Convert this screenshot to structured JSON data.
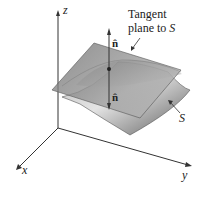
{
  "diagram": {
    "axes": {
      "z_label": "z",
      "x_label": "x",
      "y_label": "y"
    },
    "labels": {
      "tangent_line1": "Tangent",
      "tangent_line2_prefix": "plane to ",
      "tangent_line2_S": "S",
      "surface": "S",
      "normal_up": "n̂",
      "normal_down": "n̂"
    },
    "colors": {
      "axis": "#333333",
      "plane": "#8a8a8a",
      "surface_light": "#d8d8d8",
      "surface_dark": "#6e6e6e",
      "text": "#222222"
    }
  }
}
